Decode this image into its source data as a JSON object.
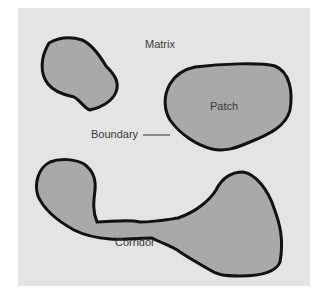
{
  "diagram": {
    "labels": {
      "matrix": "Matrix",
      "patch": "Patch",
      "boundary": "Boundary",
      "corridor": "Corridor"
    },
    "colors": {
      "background": "#e4e4e4",
      "patch_fill": "#a9a9a9",
      "outline": "#111111"
    }
  }
}
